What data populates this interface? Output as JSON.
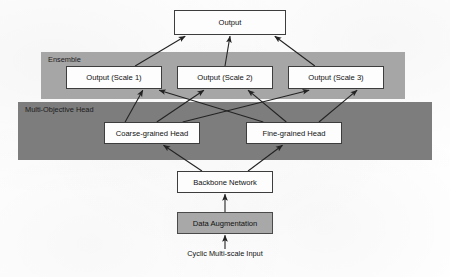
{
  "diagram": {
    "type": "flowchart",
    "canvas": {
      "width": 450,
      "height": 277,
      "background": "#ffffff"
    },
    "bands": [
      {
        "id": "ensemble",
        "label": "Ensemble",
        "color": "#a6a6a6",
        "x": 41,
        "y": 52,
        "width": 364,
        "height": 47
      },
      {
        "id": "multi-objective-head",
        "label": "Multi-Objective Head",
        "color": "#7d7d7d",
        "x": 18,
        "y": 102,
        "width": 414,
        "height": 58
      }
    ],
    "nodes": [
      {
        "id": "output",
        "label": "Output",
        "fill": "#fdfdfd",
        "stroke": "#3d3d3d",
        "x": 174,
        "y": 10,
        "width": 112,
        "height": 25
      },
      {
        "id": "output-scale-1",
        "label": "Output (Scale 1)",
        "fill": "#fdfdfd",
        "stroke": "#3d3d3d",
        "x": 66,
        "y": 66,
        "width": 96,
        "height": 23
      },
      {
        "id": "output-scale-2",
        "label": "Output (Scale 2)",
        "fill": "#fdfdfd",
        "stroke": "#3d3d3d",
        "x": 177,
        "y": 66,
        "width": 96,
        "height": 23
      },
      {
        "id": "output-scale-3",
        "label": "Output (Scale 3)",
        "fill": "#fdfdfd",
        "stroke": "#3d3d3d",
        "x": 288,
        "y": 66,
        "width": 96,
        "height": 23
      },
      {
        "id": "coarse-grained-head",
        "label": "Coarse-grained Head",
        "fill": "#fdfdfd",
        "stroke": "#3d3d3d",
        "x": 104,
        "y": 122,
        "width": 96,
        "height": 22
      },
      {
        "id": "fine-grained-head",
        "label": "Fine-grained Head",
        "fill": "#fdfdfd",
        "stroke": "#3d3d3d",
        "x": 246,
        "y": 122,
        "width": 96,
        "height": 22
      },
      {
        "id": "backbone-network",
        "label": "Backbone Network",
        "fill": "#fdfdfd",
        "stroke": "#3d3d3d",
        "x": 177,
        "y": 171,
        "width": 96,
        "height": 22
      },
      {
        "id": "data-augmentation",
        "label": "Data Augmentation",
        "fill": "#a8a8a8",
        "stroke": "#4a4a4a",
        "x": 177,
        "y": 212,
        "width": 96,
        "height": 22
      }
    ],
    "captions": [
      {
        "id": "input-caption",
        "label": "Cyclic Multi-scale Input",
        "x": 139,
        "y": 249,
        "width": 172
      }
    ],
    "edges": [
      {
        "from": "output-scale-1",
        "to": "output"
      },
      {
        "from": "output-scale-2",
        "to": "output"
      },
      {
        "from": "output-scale-3",
        "to": "output"
      },
      {
        "from": "coarse-grained-head",
        "to": "output-scale-1"
      },
      {
        "from": "coarse-grained-head",
        "to": "output-scale-2"
      },
      {
        "from": "coarse-grained-head",
        "to": "output-scale-3"
      },
      {
        "from": "fine-grained-head",
        "to": "output-scale-1"
      },
      {
        "from": "fine-grained-head",
        "to": "output-scale-2"
      },
      {
        "from": "fine-grained-head",
        "to": "output-scale-3"
      },
      {
        "from": "backbone-network",
        "to": "coarse-grained-head"
      },
      {
        "from": "backbone-network",
        "to": "fine-grained-head"
      },
      {
        "from": "data-augmentation",
        "to": "backbone-network"
      },
      {
        "from": "input-caption",
        "to": "data-augmentation"
      }
    ]
  }
}
